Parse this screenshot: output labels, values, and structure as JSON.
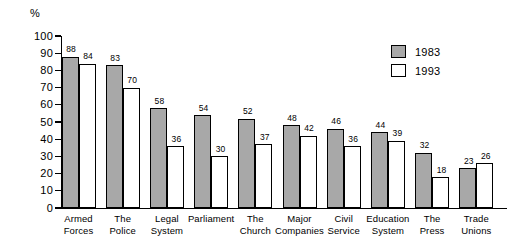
{
  "chart_data": {
    "type": "bar",
    "title": "",
    "subtitle": "",
    "xlabel": "",
    "ylabel": "%",
    "ylim": [
      0,
      100
    ],
    "ytick_step": 10,
    "yticks": [
      "100",
      "90",
      "80",
      "70",
      "60",
      "50",
      "40",
      "30",
      "20",
      "10",
      "0"
    ],
    "grid": false,
    "legend_position": "top-right",
    "categories": [
      "Armed Forces",
      "The Police",
      "Legal System",
      "Parliament",
      "The Church",
      "Major Companies",
      "Civil Service",
      "Education System",
      "The Press",
      "Trade Unions"
    ],
    "category_lines": [
      [
        "Armed",
        "Forces"
      ],
      [
        "The",
        "Police"
      ],
      [
        "Legal",
        "System"
      ],
      [
        "Parliament",
        ""
      ],
      [
        "The",
        "Church"
      ],
      [
        "Major",
        "Companies"
      ],
      [
        "Civil",
        "Service"
      ],
      [
        "Education",
        "System"
      ],
      [
        "The",
        "Press"
      ],
      [
        "Trade",
        "Unions"
      ]
    ],
    "series": [
      {
        "name": "1983",
        "color": "#a8a8a8",
        "values": [
          88,
          83,
          58,
          54,
          52,
          48,
          46,
          44,
          32,
          23
        ]
      },
      {
        "name": "1993",
        "color": "#ffffff",
        "values": [
          84,
          70,
          36,
          30,
          37,
          42,
          36,
          39,
          18,
          26
        ]
      }
    ]
  },
  "legend": {
    "items": [
      {
        "label": "1983",
        "swatch": "gray-filled-square"
      },
      {
        "label": "1993",
        "swatch": "white-outlined-square"
      }
    ]
  },
  "axis": {
    "unit_label": "%"
  },
  "colors": {
    "series_1983": "#a8a8a8",
    "series_1993": "#ffffff",
    "outline": "#000000",
    "background": "#ffffff"
  }
}
